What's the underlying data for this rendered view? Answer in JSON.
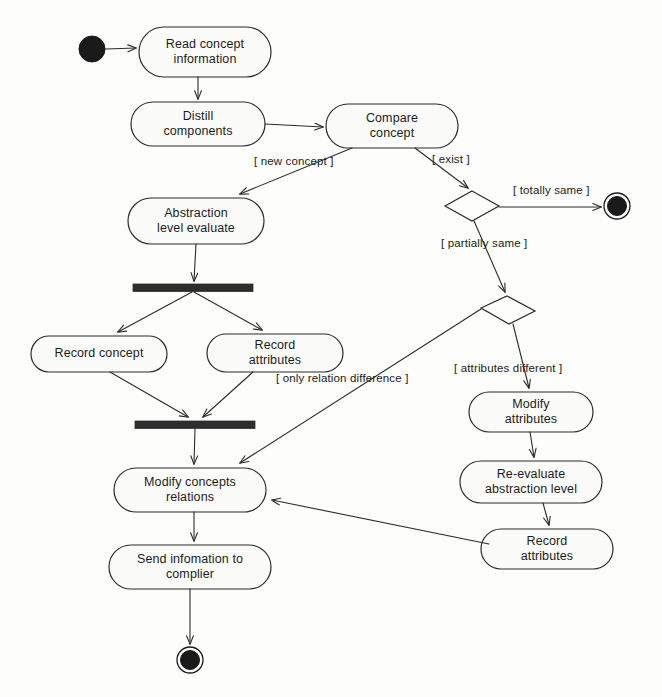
{
  "diagram": {
    "type": "uml-activity-diagram",
    "colors": {
      "stroke": "#2b2b2b",
      "fill": "#fbfbfa",
      "bar": "#2d2d2d",
      "background": "#fdfdfc",
      "text": "#1b1b1b"
    },
    "nodes": [
      {
        "id": "start",
        "kind": "initial-node",
        "label": "",
        "x": 92,
        "y": 49
      },
      {
        "id": "read-concept",
        "kind": "action",
        "label": "Read concept\ninformation",
        "x": 205,
        "y": 52,
        "w": 132,
        "h": 50
      },
      {
        "id": "distill",
        "kind": "action",
        "label": "Distill\ncomponents",
        "x": 198,
        "y": 124,
        "w": 134,
        "h": 44
      },
      {
        "id": "compare",
        "kind": "action",
        "label": "Compare\nconcept",
        "x": 392,
        "y": 126,
        "w": 132,
        "h": 44
      },
      {
        "id": "decision-exist",
        "kind": "decision",
        "label": "",
        "x": 472,
        "y": 206,
        "w": 54,
        "h": 30
      },
      {
        "id": "end-totally-same",
        "kind": "final-node",
        "label": "",
        "x": 617,
        "y": 206
      },
      {
        "id": "decision-partial",
        "kind": "decision",
        "label": "",
        "x": 508,
        "y": 310,
        "w": 54,
        "h": 28
      },
      {
        "id": "abstraction-eval",
        "kind": "action",
        "label": "Abstraction\nlevel evaluate",
        "x": 196,
        "y": 221,
        "w": 136,
        "h": 46
      },
      {
        "id": "fork-bar",
        "kind": "fork",
        "label": "",
        "x": 193,
        "y": 288,
        "w": 120,
        "h": 8
      },
      {
        "id": "record-concept",
        "kind": "action",
        "label": "Record concept",
        "x": 99,
        "y": 354,
        "w": 136,
        "h": 36
      },
      {
        "id": "record-attributes-1",
        "kind": "action",
        "label": "Record\nattributes",
        "x": 275,
        "y": 353,
        "w": 136,
        "h": 38
      },
      {
        "id": "join-bar",
        "kind": "join",
        "label": "",
        "x": 195,
        "y": 425,
        "w": 120,
        "h": 8
      },
      {
        "id": "modify-relations",
        "kind": "action",
        "label": "Modify concepts\nrelations",
        "x": 190,
        "y": 490,
        "w": 152,
        "h": 44
      },
      {
        "id": "send-info",
        "kind": "action",
        "label": "Send infomation to\ncomplier",
        "x": 190,
        "y": 567,
        "w": 162,
        "h": 44
      },
      {
        "id": "end-final",
        "kind": "final-node",
        "label": "",
        "x": 190,
        "y": 660
      },
      {
        "id": "modify-attributes",
        "kind": "action",
        "label": "Modify\nattributes",
        "x": 531,
        "y": 412,
        "w": 124,
        "h": 40
      },
      {
        "id": "re-evaluate",
        "kind": "action",
        "label": "Re-evaluate\nabstraction level",
        "x": 531,
        "y": 482,
        "w": 142,
        "h": 42
      },
      {
        "id": "record-attributes-2",
        "kind": "action",
        "label": "Record\nattributes",
        "x": 547,
        "y": 549,
        "w": 132,
        "h": 40
      }
    ],
    "edges": [
      {
        "id": "e1",
        "from": "start",
        "to": "read-concept",
        "guard": ""
      },
      {
        "id": "e2",
        "from": "read-concept",
        "to": "distill",
        "guard": ""
      },
      {
        "id": "e3",
        "from": "distill",
        "to": "compare",
        "guard": ""
      },
      {
        "id": "e4",
        "from": "compare",
        "to": "abstraction-eval",
        "guard": "[ new concept ]"
      },
      {
        "id": "e5",
        "from": "compare",
        "to": "decision-exist",
        "guard": "[ exist ]"
      },
      {
        "id": "e6",
        "from": "decision-exist",
        "to": "end-totally-same",
        "guard": "[ totally same ]"
      },
      {
        "id": "e7",
        "from": "decision-exist",
        "to": "decision-partial",
        "guard": "[ partially same ]"
      },
      {
        "id": "e8",
        "from": "decision-partial",
        "to": "modify-relations",
        "guard": "[ only relation difference ]"
      },
      {
        "id": "e9",
        "from": "decision-partial",
        "to": "modify-attributes",
        "guard": "[ attributes different ]"
      },
      {
        "id": "e10",
        "from": "abstraction-eval",
        "to": "fork-bar",
        "guard": ""
      },
      {
        "id": "e11",
        "from": "fork-bar",
        "to": "record-concept",
        "guard": ""
      },
      {
        "id": "e12",
        "from": "fork-bar",
        "to": "record-attributes-1",
        "guard": ""
      },
      {
        "id": "e13",
        "from": "record-concept",
        "to": "join-bar",
        "guard": ""
      },
      {
        "id": "e14",
        "from": "record-attributes-1",
        "to": "join-bar",
        "guard": ""
      },
      {
        "id": "e15",
        "from": "join-bar",
        "to": "modify-relations",
        "guard": ""
      },
      {
        "id": "e16",
        "from": "modify-relations",
        "to": "send-info",
        "guard": ""
      },
      {
        "id": "e17",
        "from": "send-info",
        "to": "end-final",
        "guard": ""
      },
      {
        "id": "e18",
        "from": "modify-attributes",
        "to": "re-evaluate",
        "guard": ""
      },
      {
        "id": "e19",
        "from": "re-evaluate",
        "to": "record-attributes-2",
        "guard": ""
      },
      {
        "id": "e20",
        "from": "record-attributes-2",
        "to": "modify-relations",
        "guard": ""
      }
    ],
    "guards": {
      "new_concept": "[ new concept ]",
      "exist": "[ exist ]",
      "totally_same": "[ totally same ]",
      "partially_same": "[ partially same ]",
      "attributes_different": "[ attributes different ]",
      "only_relation_difference": "[ only relation difference ]"
    },
    "labels": {
      "read_concept": "Read concept\ninformation",
      "distill": "Distill\ncomponents",
      "compare": "Compare\nconcept",
      "abstraction_eval": "Abstraction\nlevel evaluate",
      "record_concept": "Record concept",
      "record_attributes_1": "Record\nattributes",
      "modify_relations": "Modify concepts\nrelations",
      "send_info": "Send infomation to\ncomplier",
      "modify_attributes": "Modify\nattributes",
      "re_evaluate": "Re-evaluate\nabstraction level",
      "record_attributes_2": "Record\nattributes"
    }
  }
}
